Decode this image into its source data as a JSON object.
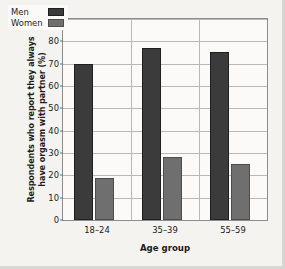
{
  "chart_data": {
    "type": "bar",
    "title": "",
    "subtitle": "",
    "categories": [
      "18–24",
      "35–39",
      "55–59"
    ],
    "series": [
      {
        "name": "Men",
        "values": [
          70,
          77,
          75
        ],
        "color": "#3b3b3b"
      },
      {
        "name": "Women",
        "values": [
          19,
          28,
          25
        ],
        "color": "#6f6f6f"
      }
    ],
    "xlabel": "Age group",
    "ylabel": "Respondents who report they always have orgasm with partner (%)",
    "ylabel_line1": "Respondents who report they always",
    "ylabel_line2": "have orgasm with partner (%)",
    "ylim": [
      0,
      90
    ],
    "ytick_step": 10,
    "yticks": [
      90,
      80,
      70,
      60,
      50,
      40,
      30,
      20,
      10,
      0
    ],
    "ytick_labels": [
      "90",
      "80",
      "70",
      "60",
      "50",
      "40",
      "30",
      "20",
      "10",
      "0"
    ],
    "grid": "horizontal-and-group-separators",
    "legend_position": "top-left-inside",
    "legend": [
      "Men",
      "Women"
    ],
    "background": "#fbfaf8",
    "figure_background": "#f4f3f0",
    "axis_color": "#8d8d8d",
    "grid_color": "#b9b8b4"
  }
}
